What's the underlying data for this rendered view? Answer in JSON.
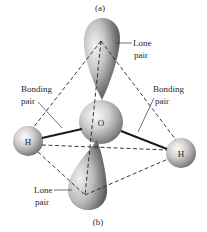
{
  "figure": {
    "top_caption": "(a)",
    "bottom_caption": "(b)"
  },
  "atoms": {
    "oxygen": {
      "symbol": "O"
    },
    "hydrogen_left": {
      "symbol": "H"
    },
    "hydrogen_right": {
      "symbol": "H"
    }
  },
  "labels": {
    "lone_pair_top": {
      "line1": "Lone",
      "line2": "pair"
    },
    "bonding_pair_left": {
      "line1": "Bonding",
      "line2": "pair"
    },
    "bonding_pair_right": {
      "line1": "Bonding",
      "line2": "pair"
    },
    "lone_pair_bottom": {
      "line1": "Lone",
      "line2": "pair"
    }
  },
  "colors": {
    "background": "#ffffff",
    "line": "#222222",
    "sphere_light": "#f2f2f2",
    "sphere_dark": "#6e6e6e"
  }
}
